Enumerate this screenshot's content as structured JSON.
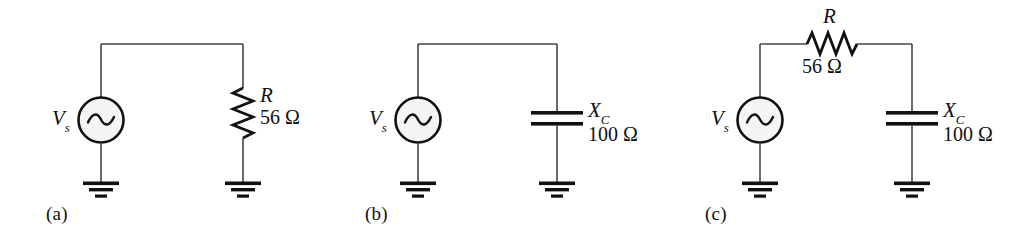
{
  "figure": {
    "type": "circuit-schematic-set",
    "background_color": "#ffffff",
    "line_color": "#1a1a1a",
    "circuit_count": 3
  },
  "circuits": [
    {
      "id": "circuit-a",
      "caption": "(a)",
      "source": {
        "label_symbol": "V",
        "label_subscript": "s",
        "kind": "ac-voltage-source"
      },
      "components": [
        {
          "kind": "resistor",
          "orientation": "vertical",
          "symbol": "R",
          "subscript": "",
          "value": "56 Ω"
        }
      ],
      "grounds": 2
    },
    {
      "id": "circuit-b",
      "caption": "(b)",
      "source": {
        "label_symbol": "V",
        "label_subscript": "s",
        "kind": "ac-voltage-source"
      },
      "components": [
        {
          "kind": "capacitor",
          "orientation": "vertical",
          "symbol": "X",
          "subscript": "C",
          "value": "100 Ω"
        }
      ],
      "grounds": 2
    },
    {
      "id": "circuit-c",
      "caption": "(c)",
      "source": {
        "label_symbol": "V",
        "label_subscript": "s",
        "kind": "ac-voltage-source"
      },
      "components": [
        {
          "kind": "resistor",
          "orientation": "horizontal",
          "symbol": "R",
          "subscript": "",
          "value": "56 Ω"
        },
        {
          "kind": "capacitor",
          "orientation": "vertical",
          "symbol": "X",
          "subscript": "C",
          "value": "100 Ω"
        }
      ],
      "grounds": 2
    }
  ]
}
